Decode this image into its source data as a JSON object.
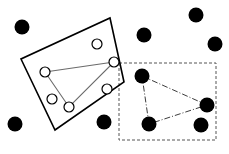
{
  "figure": {
    "width": 229,
    "height": 154,
    "background_color": "#ffffff",
    "stroke_color": "#000000",
    "open_marker_fill": "#ffffff"
  },
  "shapes": {
    "rotated_rectangle": {
      "name": "solid-rotated-rectangle",
      "style": "solid",
      "stroke_color": "#000000",
      "stroke_width": 1.6,
      "points": "110,18 124,82 55,130 21,59"
    },
    "dashed_rectangle": {
      "name": "dashed-axis-aligned-rectangle",
      "style": "dashed",
      "stroke_color": "#555555",
      "stroke_width": 1,
      "dash_array": "3,2",
      "x": 119,
      "y": 63,
      "width": 97,
      "height": 77
    },
    "solid_triangle": {
      "name": "thin-solid-triangle",
      "style": "solid",
      "stroke_color": "#6b6b6b",
      "stroke_width": 1.1,
      "points": "45,72 114,62 69,107"
    },
    "dashdot_triangle": {
      "name": "dash-dot-triangle",
      "style": "dash-dot",
      "stroke_color": "#3c3c3c",
      "stroke_width": 1,
      "dash_array": "6,2,1,2",
      "points": "142,76 207,105 149,124"
    }
  },
  "markers": {
    "filled_circles": [
      {
        "name": "filled-point-outside-top-left",
        "cx": 22,
        "cy": 27,
        "r": 7.5
      },
      {
        "name": "filled-point-outside-top-mid",
        "cx": 144,
        "cy": 35,
        "r": 7.5
      },
      {
        "name": "filled-point-outside-top-right",
        "cx": 196,
        "cy": 15,
        "r": 7.5
      },
      {
        "name": "filled-point-outside-right",
        "cx": 215,
        "cy": 44,
        "r": 7.5
      },
      {
        "name": "filled-point-outside-bottom-left",
        "cx": 15,
        "cy": 124,
        "r": 7.5
      },
      {
        "name": "filled-point-outside-bottom-mid",
        "cx": 104,
        "cy": 122,
        "r": 7.5
      },
      {
        "name": "filled-point-inside-dashed-bottom-right",
        "cx": 201,
        "cy": 125,
        "r": 7.5
      }
    ],
    "filled_triangle_vertices": [
      {
        "name": "filled-vertex-top",
        "cx": 142,
        "cy": 76,
        "r": 7.5
      },
      {
        "name": "filled-vertex-right",
        "cx": 207,
        "cy": 105,
        "r": 7.5
      },
      {
        "name": "filled-vertex-bottom",
        "cx": 149,
        "cy": 124,
        "r": 7.5
      }
    ],
    "open_circles": [
      {
        "name": "open-point-upper-right",
        "cx": 97,
        "cy": 44,
        "r": 5
      },
      {
        "name": "open-point-lower-right",
        "cx": 107,
        "cy": 89,
        "r": 5
      },
      {
        "name": "open-point-lower-left",
        "cx": 52,
        "cy": 99,
        "r": 5
      }
    ],
    "open_triangle_vertices": [
      {
        "name": "open-vertex-left",
        "cx": 45,
        "cy": 72,
        "r": 5
      },
      {
        "name": "open-vertex-right",
        "cx": 114,
        "cy": 62,
        "r": 5
      },
      {
        "name": "open-vertex-bottom",
        "cx": 69,
        "cy": 107,
        "r": 5
      }
    ]
  }
}
